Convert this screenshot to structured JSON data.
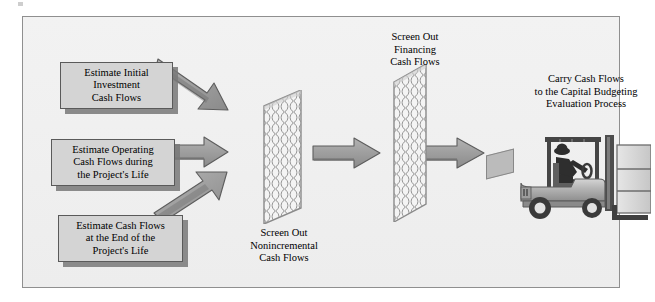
{
  "diagram": {
    "background_color": "#f0f0f0",
    "border_color": "#8f8f8f",
    "box_fill_color": "#d4d4d4",
    "box_border_color": "#5a5a5a",
    "arrow_fill_color": "#9a9a9a",
    "arrow_edge_color": "#5d5d5d",
    "screen_mesh_color": "#9b9b9b",
    "inputs": [
      {
        "id": "initial-investment",
        "lines": [
          "Estimate Initial",
          "Investment",
          "Cash Flows"
        ],
        "text": "Estimate Initial Investment Cash Flows"
      },
      {
        "id": "operating",
        "lines": [
          "Estimate Operating",
          "Cash Flows during",
          "the Project's Life"
        ],
        "text": "Estimate Operating Cash Flows during the Project's Life"
      },
      {
        "id": "end-of-life",
        "lines": [
          "Estimate Cash Flows",
          "at the End of the",
          "Project's Life"
        ],
        "text": "Estimate Cash Flows at the End of the Project's Life"
      }
    ],
    "screens": [
      {
        "id": "nonincremental",
        "lines": [
          "Screen Out",
          "Nonincremental",
          "Cash Flows"
        ],
        "text": "Screen Out Nonincremental Cash Flows",
        "caption_position": "below"
      },
      {
        "id": "financing",
        "lines": [
          "Screen Out",
          "Financing",
          "Cash Flows"
        ],
        "text": "Screen Out Financing Cash Flows",
        "caption_position": "above"
      }
    ],
    "output": {
      "id": "carry-cash-flows",
      "lines": [
        "Carry Cash Flows",
        "to the Capital Budgeting",
        "Evaluation Process"
      ],
      "text": "Carry Cash Flows to the Capital Budgeting Evaluation Process"
    },
    "illustration": {
      "id": "forklift",
      "icon": "forklift-icon",
      "description": "Forklift with driver carrying stacked boxes"
    },
    "arrows": [
      {
        "id": "arrow-initial-to-screen1",
        "direction": "down-right"
      },
      {
        "id": "arrow-operating-to-screen1",
        "direction": "right"
      },
      {
        "id": "arrow-end-to-screen1",
        "direction": "up-right"
      },
      {
        "id": "arrow-screen1-to-screen2",
        "direction": "right"
      },
      {
        "id": "arrow-screen2-to-forklift",
        "direction": "right"
      }
    ]
  }
}
